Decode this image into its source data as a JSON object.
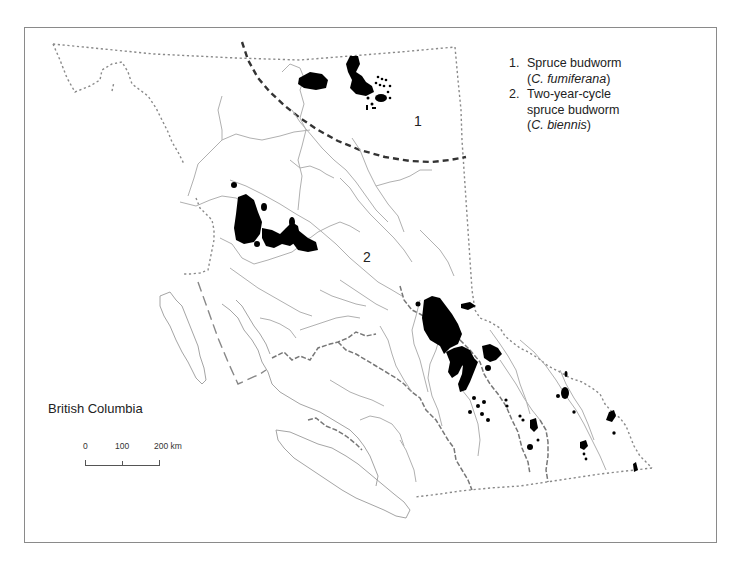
{
  "map": {
    "title": "British Columbia",
    "region_labels": [
      {
        "id": "1",
        "label": "1"
      },
      {
        "id": "2",
        "label": "2"
      }
    ],
    "legend": [
      {
        "number": "1.",
        "common_name": "Spruce budworm",
        "scientific_prefix": "(",
        "scientific_name": "C. fumiferana",
        "scientific_suffix": ")"
      },
      {
        "number": "2.",
        "common_name_line1": "Two-year-cycle",
        "common_name_line2": "spruce budworm",
        "scientific_prefix": "(",
        "scientific_name": "C. biennis",
        "scientific_suffix": ")"
      }
    ],
    "scale_bar": {
      "ticks": [
        "0",
        "100",
        "200 km"
      ]
    },
    "colors": {
      "outbreak_fill": "#000000",
      "border_line": "#8a8a8a",
      "river_line": "#b0b0b0",
      "range_divider": "#333333",
      "frame": "#8a8a8a"
    }
  }
}
